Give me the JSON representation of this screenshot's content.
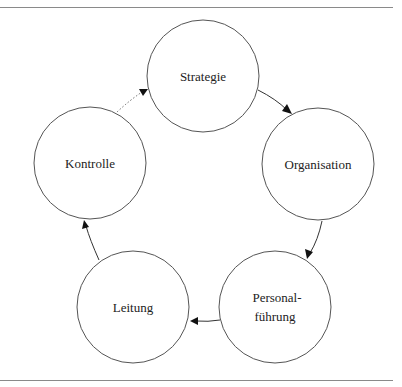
{
  "diagram": {
    "type": "cycle",
    "nodes": [
      {
        "id": "strategie",
        "label_lines": [
          "Strategie"
        ],
        "cx": 203,
        "cy": 76,
        "r": 56
      },
      {
        "id": "organisation",
        "label_lines": [
          "Organisation"
        ],
        "cx": 318,
        "cy": 164,
        "r": 56
      },
      {
        "id": "personalfuehrung",
        "label_lines": [
          "Personal-",
          "führung"
        ],
        "cx": 275,
        "cy": 307,
        "r": 56
      },
      {
        "id": "leitung",
        "label_lines": [
          "Leitung"
        ],
        "cx": 133,
        "cy": 307,
        "r": 56
      },
      {
        "id": "kontrolle",
        "label_lines": [
          "Kontrolle"
        ],
        "cx": 90,
        "cy": 163,
        "r": 56
      }
    ],
    "edges": [
      {
        "from": "strategie",
        "to": "organisation",
        "style": "solid"
      },
      {
        "from": "organisation",
        "to": "personalfuehrung",
        "style": "solid"
      },
      {
        "from": "personalfuehrung",
        "to": "leitung",
        "style": "solid"
      },
      {
        "from": "leitung",
        "to": "kontrolle",
        "style": "solid"
      },
      {
        "from": "kontrolle",
        "to": "strategie",
        "style": "dotted"
      }
    ],
    "colors": {
      "stroke": "#555555",
      "text": "#222222",
      "rule": "#8a8a8a"
    }
  }
}
